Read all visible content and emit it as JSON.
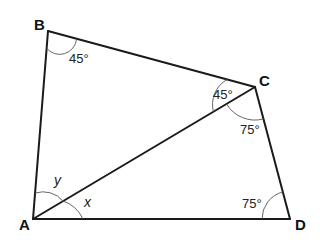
{
  "diagram": {
    "type": "quadrilateral-with-diagonal",
    "vertices": [
      {
        "name": "A",
        "x": 33,
        "y": 219
      },
      {
        "name": "B",
        "x": 48,
        "y": 31
      },
      {
        "name": "C",
        "x": 255,
        "y": 87
      },
      {
        "name": "D",
        "x": 290,
        "y": 219
      }
    ],
    "edges": [
      "AB",
      "BC",
      "CD",
      "DA",
      "AC"
    ],
    "labels": {
      "A": "A",
      "B": "B",
      "C": "C",
      "D": "D"
    },
    "angles": {
      "angle_B": "45°",
      "angle_ACB": "45°",
      "angle_ACD": "75°",
      "angle_D": "75°",
      "angle_BAC": "y",
      "angle_CAD": "x"
    }
  }
}
